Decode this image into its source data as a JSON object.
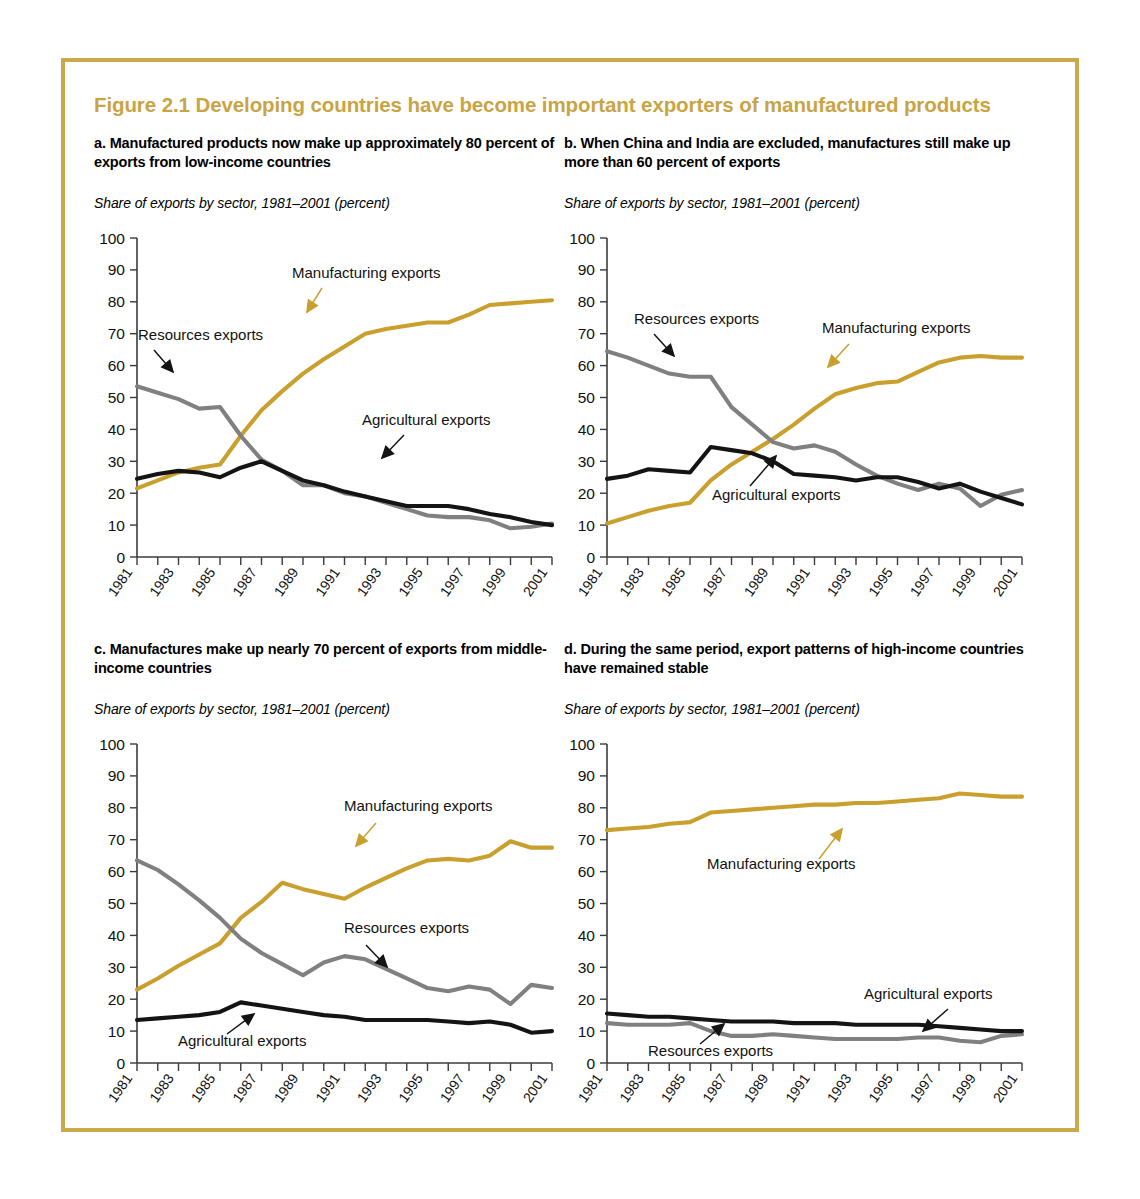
{
  "figure": {
    "title": "Figure 2.1  Developing countries have become important exporters of manufactured products",
    "accent_color": "#c9a445",
    "border_color": "#c9a94a"
  },
  "series_colors": {
    "manufacturing": "#c9a02e",
    "resources": "#808080",
    "agricultural": "#141414"
  },
  "panels": [
    {
      "id": "a",
      "title": "a. Manufactured products now make up approximately 80 percent of exports from low-income countries",
      "subtitle": "Share of exports by sector, 1981–2001 (percent)",
      "annotations": [
        {
          "name": "manufacturing-label",
          "text": "Manufacturing exports"
        },
        {
          "name": "resources-label",
          "text": "Resources exports"
        },
        {
          "name": "agricultural-label",
          "text": "Agricultural exports"
        }
      ]
    },
    {
      "id": "b",
      "title": "b. When China and India are excluded, manufactures still make up more than 60 percent of exports",
      "subtitle": "Share of exports by sector, 1981–2001 (percent)",
      "annotations": [
        {
          "name": "manufacturing-label",
          "text": "Manufacturing exports"
        },
        {
          "name": "resources-label",
          "text": "Resources exports"
        },
        {
          "name": "agricultural-label",
          "text": "Agricultural exports"
        }
      ]
    },
    {
      "id": "c",
      "title": "c. Manufactures make up nearly 70 percent of exports from middle-income countries",
      "subtitle": "Share of exports by sector, 1981–2001 (percent)",
      "annotations": [
        {
          "name": "manufacturing-label",
          "text": "Manufacturing exports"
        },
        {
          "name": "resources-label",
          "text": "Resources exports"
        },
        {
          "name": "agricultural-label",
          "text": "Agricultural exports"
        }
      ]
    },
    {
      "id": "d",
      "title": "d. During the same period, export patterns of high-income countries have remained stable",
      "subtitle": "Share of exports by sector, 1981–2001 (percent)",
      "annotations": [
        {
          "name": "manufacturing-label",
          "text": "Manufacturing exports"
        },
        {
          "name": "resources-label",
          "text": "Resources exports"
        },
        {
          "name": "agricultural-label",
          "text": "Agricultural exports"
        }
      ]
    }
  ],
  "axis": {
    "y_ticks": [
      0,
      10,
      20,
      30,
      40,
      50,
      60,
      70,
      80,
      90,
      100
    ],
    "ylim": [
      0,
      100
    ],
    "x_years": [
      1981,
      1982,
      1983,
      1984,
      1985,
      1986,
      1987,
      1988,
      1989,
      1990,
      1991,
      1992,
      1993,
      1994,
      1995,
      1996,
      1997,
      1998,
      1999,
      2000,
      2001
    ],
    "x_tick_labels": [
      "1981",
      "1983",
      "1985",
      "1987",
      "1989",
      "1991",
      "1993",
      "1995",
      "1997",
      "1999",
      "2001"
    ],
    "xlim": [
      1981,
      2001
    ],
    "grid": false
  },
  "chart_data": [
    {
      "panel": "a",
      "type": "line",
      "title": "a. Manufactured products now make up approximately 80 percent of exports from low-income countries",
      "subtitle": "Share of exports by sector, 1981–2001 (percent)",
      "xlabel": "",
      "ylabel": "percent",
      "ylim": [
        0,
        100
      ],
      "x": [
        1981,
        1982,
        1983,
        1984,
        1985,
        1986,
        1987,
        1988,
        1989,
        1990,
        1991,
        1992,
        1993,
        1994,
        1995,
        1996,
        1997,
        1998,
        1999,
        2000,
        2001
      ],
      "x_tick_labels": [
        "1981",
        "1983",
        "1985",
        "1987",
        "1989",
        "1991",
        "1993",
        "1995",
        "1997",
        "1999",
        "2001"
      ],
      "legend_position": "inline-annotations",
      "series": [
        {
          "name": "Manufacturing exports",
          "color": "#c9a02e",
          "values": [
            21.5,
            24.0,
            26.5,
            28.0,
            29.0,
            38.0,
            46.0,
            52.0,
            57.5,
            62.0,
            66.0,
            70.0,
            71.5,
            72.5,
            73.5,
            73.5,
            76.0,
            79.0,
            79.5,
            80.0,
            80.5
          ]
        },
        {
          "name": "Resources exports",
          "color": "#808080",
          "values": [
            53.5,
            51.5,
            49.5,
            46.5,
            47.0,
            38.0,
            30.5,
            27.0,
            22.5,
            22.5,
            20.0,
            19.0,
            17.0,
            15.0,
            13.0,
            12.5,
            12.5,
            11.5,
            9.0,
            9.5,
            10.5
          ]
        },
        {
          "name": "Agricultural exports",
          "color": "#141414",
          "values": [
            24.5,
            26.0,
            27.0,
            26.5,
            25.0,
            28.0,
            30.0,
            27.0,
            24.0,
            22.5,
            20.5,
            19.0,
            17.5,
            16.0,
            16.0,
            16.0,
            15.0,
            13.5,
            12.5,
            11.0,
            10.0
          ]
        }
      ]
    },
    {
      "panel": "b",
      "type": "line",
      "title": "b. When China and India are excluded, manufactures still make up more than 60 percent of exports",
      "subtitle": "Share of exports by sector, 1981–2001 (percent)",
      "xlabel": "",
      "ylabel": "percent",
      "ylim": [
        0,
        100
      ],
      "x": [
        1981,
        1982,
        1983,
        1984,
        1985,
        1986,
        1987,
        1988,
        1989,
        1990,
        1991,
        1992,
        1993,
        1994,
        1995,
        1996,
        1997,
        1998,
        1999,
        2000,
        2001
      ],
      "x_tick_labels": [
        "1981",
        "1983",
        "1985",
        "1987",
        "1989",
        "1991",
        "1993",
        "1995",
        "1997",
        "1999",
        "2001"
      ],
      "legend_position": "inline-annotations",
      "series": [
        {
          "name": "Manufacturing exports",
          "color": "#c9a02e",
          "values": [
            10.5,
            12.5,
            14.5,
            16.0,
            17.0,
            24.0,
            29.0,
            33.0,
            37.0,
            41.5,
            46.5,
            51.0,
            53.0,
            54.5,
            55.0,
            58.0,
            61.0,
            62.5,
            63.0,
            62.5,
            62.5
          ]
        },
        {
          "name": "Resources exports",
          "color": "#808080",
          "values": [
            64.5,
            62.5,
            60.0,
            57.5,
            56.5,
            56.5,
            47.0,
            41.5,
            36.0,
            34.0,
            35.0,
            33.0,
            29.0,
            25.5,
            23.0,
            21.0,
            23.0,
            21.5,
            16.0,
            19.5,
            21.0
          ]
        },
        {
          "name": "Agricultural exports",
          "color": "#141414",
          "values": [
            24.5,
            25.5,
            27.5,
            27.0,
            26.5,
            34.5,
            33.5,
            32.5,
            30.0,
            26.0,
            25.5,
            25.0,
            24.0,
            25.0,
            25.0,
            23.5,
            21.5,
            23.0,
            20.5,
            18.5,
            16.5
          ]
        }
      ]
    },
    {
      "panel": "c",
      "type": "line",
      "title": "c. Manufactures make up nearly 70 percent of exports from middle-income countries",
      "subtitle": "Share of exports by sector, 1981–2001 (percent)",
      "xlabel": "",
      "ylabel": "percent",
      "ylim": [
        0,
        100
      ],
      "x": [
        1981,
        1982,
        1983,
        1984,
        1985,
        1986,
        1987,
        1988,
        1989,
        1990,
        1991,
        1992,
        1993,
        1994,
        1995,
        1996,
        1997,
        1998,
        1999,
        2000,
        2001
      ],
      "x_tick_labels": [
        "1981",
        "1983",
        "1985",
        "1987",
        "1989",
        "1991",
        "1993",
        "1995",
        "1997",
        "1999",
        "2001"
      ],
      "legend_position": "inline-annotations",
      "series": [
        {
          "name": "Manufacturing exports",
          "color": "#c9a02e",
          "values": [
            23.0,
            26.5,
            30.5,
            34.0,
            37.5,
            45.5,
            50.5,
            56.5,
            54.5,
            53.0,
            51.5,
            55.0,
            58.0,
            61.0,
            63.5,
            64.0,
            63.5,
            65.0,
            69.5,
            67.5,
            67.5
          ]
        },
        {
          "name": "Resources exports",
          "color": "#808080",
          "values": [
            63.5,
            60.5,
            56.0,
            51.0,
            45.5,
            39.0,
            34.5,
            31.0,
            27.5,
            31.5,
            33.5,
            32.5,
            29.5,
            26.5,
            23.5,
            22.5,
            24.0,
            23.0,
            18.5,
            24.5,
            23.5
          ]
        },
        {
          "name": "Agricultural exports",
          "color": "#141414",
          "values": [
            13.5,
            14.0,
            14.5,
            15.0,
            16.0,
            19.0,
            18.0,
            17.0,
            16.0,
            15.0,
            14.5,
            13.5,
            13.5,
            13.5,
            13.5,
            13.0,
            12.5,
            13.0,
            12.0,
            9.5,
            10.0
          ]
        }
      ]
    },
    {
      "panel": "d",
      "type": "line",
      "title": "d. During the same period, export patterns of high-income countries have remained stable",
      "subtitle": "Share of exports by sector, 1981–2001 (percent)",
      "xlabel": "",
      "ylabel": "percent",
      "ylim": [
        0,
        100
      ],
      "x": [
        1981,
        1982,
        1983,
        1984,
        1985,
        1986,
        1987,
        1988,
        1989,
        1990,
        1991,
        1992,
        1993,
        1994,
        1995,
        1996,
        1997,
        1998,
        1999,
        2000,
        2001
      ],
      "x_tick_labels": [
        "1981",
        "1983",
        "1985",
        "1987",
        "1989",
        "1991",
        "1993",
        "1995",
        "1997",
        "1999",
        "2001"
      ],
      "legend_position": "inline-annotations",
      "series": [
        {
          "name": "Manufacturing exports",
          "color": "#c9a02e",
          "values": [
            73.0,
            73.5,
            74.0,
            75.0,
            75.5,
            78.5,
            79.0,
            79.5,
            80.0,
            80.5,
            81.0,
            81.0,
            81.5,
            81.5,
            82.0,
            82.5,
            83.0,
            84.5,
            84.0,
            83.5,
            83.5
          ]
        },
        {
          "name": "Resources exports",
          "color": "#808080",
          "values": [
            12.5,
            12.0,
            12.0,
            12.0,
            12.5,
            10.0,
            8.5,
            8.5,
            9.0,
            8.5,
            8.0,
            7.5,
            7.5,
            7.5,
            7.5,
            8.0,
            8.0,
            7.0,
            6.5,
            8.5,
            9.0
          ]
        },
        {
          "name": "Agricultural exports",
          "color": "#141414",
          "values": [
            15.5,
            15.0,
            14.5,
            14.5,
            14.0,
            13.5,
            13.0,
            13.0,
            13.0,
            12.5,
            12.5,
            12.5,
            12.0,
            12.0,
            12.0,
            12.0,
            11.5,
            11.0,
            10.5,
            10.0,
            10.0
          ]
        }
      ]
    }
  ]
}
